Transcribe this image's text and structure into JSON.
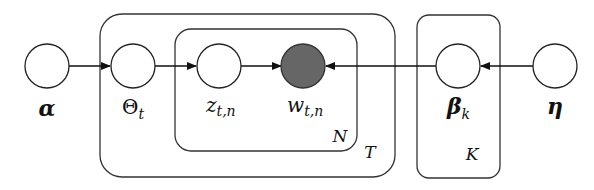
{
  "diagram": {
    "type": "plate-notation graphical model",
    "nodes": [
      {
        "id": "alpha",
        "label": "α",
        "observed": false
      },
      {
        "id": "theta",
        "label": "Θ",
        "subscript": "t",
        "observed": false
      },
      {
        "id": "z",
        "label": "z",
        "subscript": "t,n",
        "observed": false
      },
      {
        "id": "w",
        "label": "w",
        "subscript": "t,n",
        "observed": true
      },
      {
        "id": "beta",
        "label": "β",
        "subscript": "k",
        "observed": false
      },
      {
        "id": "eta",
        "label": "η",
        "observed": false
      }
    ],
    "edges": [
      {
        "from": "alpha",
        "to": "theta"
      },
      {
        "from": "theta",
        "to": "z"
      },
      {
        "from": "z",
        "to": "w"
      },
      {
        "from": "beta",
        "to": "w"
      },
      {
        "from": "eta",
        "to": "beta"
      }
    ],
    "plates": [
      {
        "id": "N",
        "label": "N",
        "contains": [
          "z",
          "w"
        ]
      },
      {
        "id": "T",
        "label": "T",
        "contains": [
          "theta",
          "z",
          "w"
        ]
      },
      {
        "id": "K",
        "label": "K",
        "contains": [
          "beta"
        ]
      }
    ],
    "colors": {
      "observed_fill": "#666666",
      "stroke": "#222222"
    }
  }
}
